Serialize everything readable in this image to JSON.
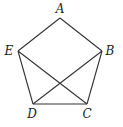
{
  "diagram": {
    "type": "geometry",
    "shape": "pentagon",
    "vertices": [
      {
        "name": "A",
        "x": 60,
        "y": 18,
        "label_x": 60,
        "label_y": 13
      },
      {
        "name": "B",
        "x": 102,
        "y": 51,
        "label_x": 110,
        "label_y": 55
      },
      {
        "name": "C",
        "x": 87,
        "y": 104,
        "label_x": 87,
        "label_y": 117
      },
      {
        "name": "D",
        "x": 33,
        "y": 104,
        "label_x": 31,
        "label_y": 117
      },
      {
        "name": "E",
        "x": 18,
        "y": 51,
        "label_x": 9,
        "label_y": 55
      }
    ],
    "edges": [
      {
        "from": "A",
        "to": "B",
        "kind": "side"
      },
      {
        "from": "B",
        "to": "C",
        "kind": "side"
      },
      {
        "from": "C",
        "to": "D",
        "kind": "side"
      },
      {
        "from": "D",
        "to": "E",
        "kind": "side"
      },
      {
        "from": "E",
        "to": "A",
        "kind": "side"
      },
      {
        "from": "E",
        "to": "C",
        "kind": "diagonal"
      },
      {
        "from": "B",
        "to": "D",
        "kind": "diagonal"
      }
    ],
    "labels": {
      "A": "A",
      "B": "B",
      "C": "C",
      "D": "D",
      "E": "E"
    },
    "stroke_color": "#333333"
  }
}
